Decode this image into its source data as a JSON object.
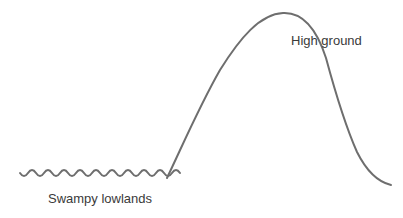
{
  "diagram": {
    "stroke_color": "#6e6e6e",
    "text_color": "#3a3a3a",
    "labels": {
      "high_ground": "High ground",
      "swampy_lowlands": "Swampy lowlands"
    },
    "elements": [
      {
        "id": "swamp-wave",
        "type": "wavy-line",
        "desc": "Wavy line representing swampy lowlands"
      },
      {
        "id": "hill-curve",
        "type": "curve",
        "desc": "Bell-shaped curve rising to high ground and descending"
      }
    ]
  }
}
